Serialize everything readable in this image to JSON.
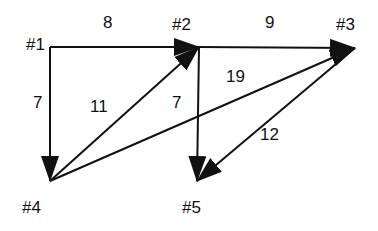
{
  "diagram": {
    "type": "directed-weighted-graph",
    "line_color": "#111111",
    "background": "#ffffff",
    "nodes": [
      {
        "id": "1",
        "label": "#1",
        "x": 50,
        "y": 47,
        "label_x": 26,
        "label_y": 36
      },
      {
        "id": "2",
        "label": "#2",
        "x": 199,
        "y": 47,
        "label_x": 172,
        "label_y": 16
      },
      {
        "id": "3",
        "label": "#3",
        "x": 355,
        "y": 48,
        "label_x": 336,
        "label_y": 16
      },
      {
        "id": "4",
        "label": "#4",
        "x": 50,
        "y": 181,
        "label_x": 22,
        "label_y": 199
      },
      {
        "id": "5",
        "label": "#5",
        "x": 197,
        "y": 181,
        "label_x": 182,
        "label_y": 199
      }
    ],
    "edges": [
      {
        "from": "1",
        "to": "2",
        "weight": "8",
        "label_x": 103,
        "label_y": 14
      },
      {
        "from": "2",
        "to": "3",
        "weight": "9",
        "label_x": 265,
        "label_y": 14
      },
      {
        "from": "1",
        "to": "4",
        "weight": "7",
        "label_x": 33,
        "label_y": 94
      },
      {
        "from": "4",
        "to": "2",
        "weight": "11",
        "label_x": 90,
        "label_y": 98
      },
      {
        "from": "2",
        "to": "5",
        "weight": "7",
        "label_x": 172,
        "label_y": 94
      },
      {
        "from": "4",
        "to": "3",
        "weight": "19",
        "label_x": 226,
        "label_y": 68
      },
      {
        "from": "3",
        "to": "5",
        "weight": "12",
        "label_x": 260,
        "label_y": 126
      }
    ]
  }
}
